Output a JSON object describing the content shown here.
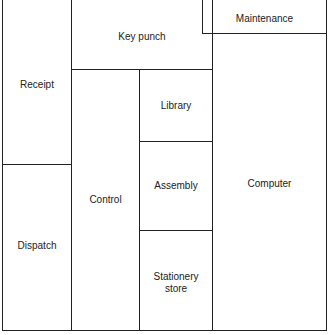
{
  "diagram": {
    "type": "floor-plan",
    "rooms": {
      "receipt": "Receipt",
      "dispatch": "Dispatch",
      "key_punch": "Key punch",
      "control": "Control",
      "library": "Library",
      "assembly": "Assembly",
      "stationery_store_line1": "Stationery",
      "stationery_store_line2": "store",
      "maintenance": "Maintenance",
      "computer": "Computer"
    },
    "line_color": "#222222",
    "background": "#ffffff"
  }
}
